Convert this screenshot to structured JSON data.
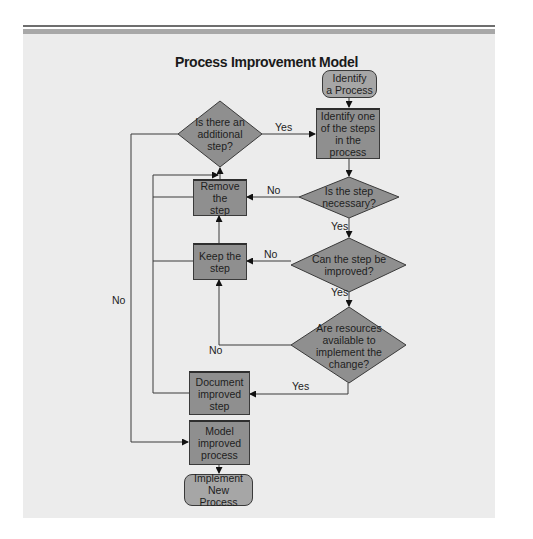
{
  "diagram": {
    "title": "Process Improvement Model",
    "colors": {
      "panel_bg": "#ececec",
      "box_fill": "#8f8f8f",
      "pill_fill": "#a6a6a6",
      "diamond_fill": "#8f8f8f",
      "line": "#3a3a3a"
    },
    "nodes": {
      "start": "Identify\na Process",
      "identify_step": "Identify one\nof the steps\nin the process",
      "additional_step": "Is there an\nadditional\nstep?",
      "step_necessary": "Is the step\nnecessary?",
      "remove_step": "Remove the\nstep",
      "can_improve": "Can the step be\nimproved?",
      "keep_step": "Keep the\nstep",
      "resources_available": "Are resources\navailable to\nimplement the\nchange?",
      "document_step": "Document\nimproved\nstep",
      "model_process": "Model\nimproved\nprocess",
      "end": "Implement New\nProcess"
    },
    "edge_labels": {
      "additional_yes": "Yes",
      "additional_no": "No",
      "necessary_no": "No",
      "necessary_yes": "Yes",
      "improve_no": "No",
      "improve_yes": "Yes",
      "resources_no": "No",
      "resources_yes": "Yes"
    }
  }
}
